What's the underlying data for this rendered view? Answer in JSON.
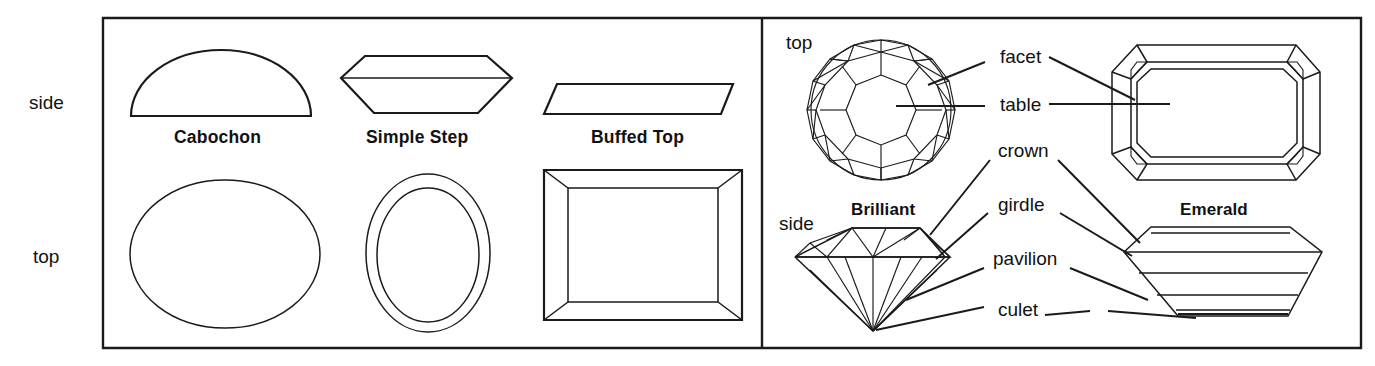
{
  "figure": {
    "background_color": "#ffffff",
    "line_color": "#1a1a1a"
  },
  "row_labels": {
    "side": "side",
    "top": "top"
  },
  "left_panel": {
    "row_label_side": "side",
    "row_label_top": "top",
    "cuts": [
      {
        "name": "Cabochon",
        "side_view": "dome",
        "top_view": "ellipse"
      },
      {
        "name": "Simple Step",
        "side_view": "hexagon-profile",
        "top_view": "concentric-ovals"
      },
      {
        "name": "Buffed Top",
        "side_view": "flat-trapezoid",
        "top_view": "beveled-rectangle"
      }
    ]
  },
  "right_panel": {
    "brilliant": {
      "name": "Brilliant",
      "view_label_top": "top",
      "view_label_side": "side"
    },
    "emerald": {
      "name": "Emerald"
    },
    "callouts": [
      {
        "label": "facet"
      },
      {
        "label": "table"
      },
      {
        "label": "crown"
      },
      {
        "label": "girdle"
      },
      {
        "label": "pavilion"
      },
      {
        "label": "culet"
      }
    ]
  }
}
